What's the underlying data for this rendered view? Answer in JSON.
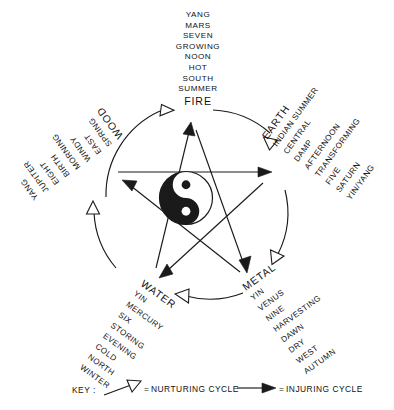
{
  "figure": {
    "nodes": [
      {
        "key": "fire",
        "element": "FIRE",
        "attributes": [
          "YANG",
          "MARS",
          "SEVEN",
          "GROWING",
          "NOON",
          "HOT",
          "SOUTH",
          "SUMMER"
        ]
      },
      {
        "key": "earth",
        "element": "EARTH",
        "attributes": [
          "YIN/YANG",
          "SATURN",
          "FIVE",
          "TRANSFORMING",
          "AFTERNOON",
          "DAMP",
          "CENTRAL",
          "INDIAN SUMMER"
        ]
      },
      {
        "key": "metal",
        "element": "METAL",
        "attributes": [
          "AUTUMN",
          "WEST",
          "DRY",
          "DAWN",
          "HARVESTING",
          "NINE",
          "VENUS",
          "YIN"
        ]
      },
      {
        "key": "water",
        "element": "WATER",
        "attributes": [
          "WINTER",
          "NORTH",
          "COLD",
          "EVENING",
          "STORING",
          "SIX",
          "MERCURY",
          "YIN"
        ]
      },
      {
        "key": "wood",
        "element": "WOOD",
        "attributes": [
          "YANG",
          "JUPITER",
          "EIGHT",
          "BIRTH",
          "MORNING",
          "WINDY",
          "EAST",
          "SPRING"
        ]
      }
    ],
    "center_symbol": "yin-yang",
    "cycles": {
      "nurturing": {
        "label": "NURTURING CYCLE",
        "arrow": "open-arrow",
        "path": [
          "WOOD",
          "FIRE",
          "EARTH",
          "METAL",
          "WATER",
          "WOOD"
        ]
      },
      "injuring": {
        "label": "INJURING CYCLE",
        "arrow": "solid-arrow",
        "path": [
          "WOOD",
          "EARTH",
          "WATER",
          "FIRE",
          "METAL",
          "WOOD"
        ]
      }
    },
    "key": {
      "label": "KEY :",
      "equals": "=",
      "nurturing_label": "NURTURING CYCLE",
      "injuring_label": "INJURING CYCLE"
    },
    "colors": {
      "ink": "#1a1a1a",
      "paper": "#ffffff"
    }
  }
}
